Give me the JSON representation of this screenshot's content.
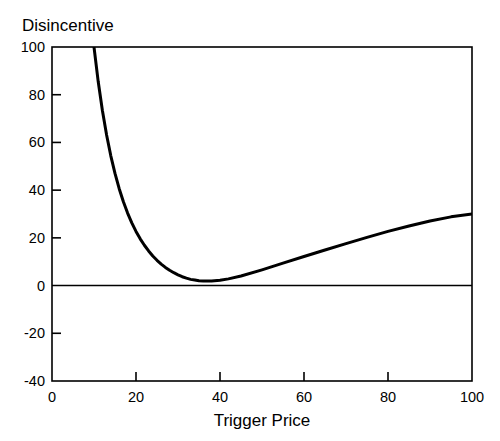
{
  "figure": {
    "background_color": "#ffffff",
    "ink_color": "#000000"
  },
  "labels": {
    "ylabel_text": "Disincentive",
    "xlabel_text": "Trigger Price"
  },
  "chart_data": {
    "type": "line",
    "title": "",
    "subtitle": "",
    "xlabel": "Trigger Price",
    "ylabel": "Disincentive",
    "ylabel_position": "above-axis-top-left",
    "xlim": [
      0,
      100
    ],
    "ylim": [
      -40,
      100
    ],
    "xticks": [
      0,
      20,
      40,
      60,
      80,
      100
    ],
    "xtick_labels": [
      "0",
      "20",
      "40",
      "60",
      "80",
      "100"
    ],
    "yticks": [
      -40,
      -20,
      0,
      20,
      40,
      60,
      80,
      100
    ],
    "ytick_labels": [
      "-40",
      "-20",
      "0",
      "20",
      "40",
      "60",
      "80",
      "100"
    ],
    "grid": false,
    "legend": null,
    "legend_position": "none",
    "tick_direction": "in",
    "frame": "box",
    "reference_lines": [
      {
        "name": "zero-line",
        "orientation": "horizontal",
        "y": 0
      }
    ],
    "annotations": [],
    "series": [
      {
        "name": "disincentive",
        "color": "#000000",
        "line_width": 3.0,
        "marker": "none",
        "minimum_point": {
          "x": 33,
          "y": 0
        },
        "note": "Convex curve: steep hyperbolic fall from y=100 near x=10 to a minimum of ~0 at x=33, then near-linear rise to y=30 at x=100",
        "x": [
          9.5,
          10,
          11,
          12,
          13,
          14,
          15,
          16,
          17,
          18,
          19,
          20,
          21,
          22,
          23,
          24,
          25,
          26,
          27,
          28,
          29,
          30,
          31,
          32,
          33,
          34,
          35,
          36,
          38,
          40,
          42,
          45,
          50,
          55,
          60,
          65,
          70,
          75,
          80,
          85,
          90,
          95,
          100
        ],
        "y": [
          103,
          100,
          85.5,
          73.4,
          63.1,
          54.4,
          47.0,
          40.6,
          35.1,
          30.4,
          26.3,
          22.7,
          19.6,
          16.9,
          14.5,
          12.4,
          10.6,
          9.0,
          7.6,
          6.4,
          5.4,
          4.5,
          3.7,
          3.1,
          2.6,
          2.3,
          2.0,
          1.9,
          1.9,
          2.2,
          2.8,
          4.0,
          6.6,
          9.4,
          12.2,
          14.9,
          17.6,
          20.2,
          22.7,
          25.0,
          27.1,
          28.8,
          30.0
        ]
      }
    ]
  }
}
